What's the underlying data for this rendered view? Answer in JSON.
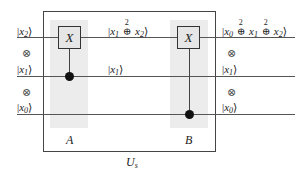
{
  "diagram": {
    "type": "quantum-circuit",
    "frame_label": "U_s",
    "inputs": [
      {
        "id": "x2",
        "label": "|x2⟩"
      },
      {
        "id": "x1",
        "label": "|x1⟩"
      },
      {
        "id": "x0",
        "label": "|x0⟩"
      }
    ],
    "tensor_symbol": "⊗",
    "gates": [
      {
        "name": "A",
        "gate_label": "X",
        "target": "x2",
        "control": "x1"
      },
      {
        "name": "B",
        "gate_label": "X",
        "target": "x2",
        "control": "x0"
      }
    ],
    "intermediate": [
      {
        "wire": "x2",
        "label": "|x1 ⊕² x2⟩"
      },
      {
        "wire": "x1",
        "label": "|x1⟩"
      }
    ],
    "outputs": [
      {
        "wire": "x2",
        "label": "|x0 ⊕² x1 ⊕² x2⟩"
      },
      {
        "wire": "x1",
        "label": "|x1⟩"
      },
      {
        "wire": "x0",
        "label": "|x0⟩"
      }
    ],
    "operator_superscript": "2",
    "gate_symbol": "X",
    "section_labels": {
      "a": "A",
      "b": "B"
    },
    "frame_label_display": "U",
    "frame_label_sub": "s"
  }
}
